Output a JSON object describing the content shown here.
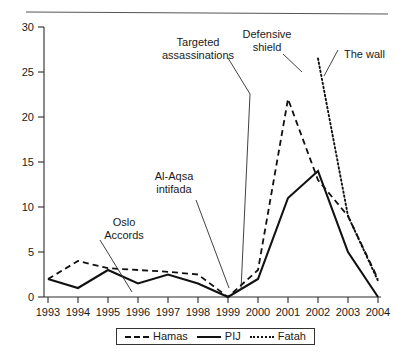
{
  "chart_data": {
    "type": "line",
    "title": "",
    "subtitle": "",
    "xlabel": "",
    "ylabel": "",
    "xlim": [
      1993,
      2004
    ],
    "ylim": [
      0,
      30
    ],
    "grid": false,
    "legend_position": "bottom",
    "x": [
      1993,
      1994,
      1995,
      1996,
      1997,
      1998,
      1999,
      2000,
      2001,
      2002,
      2003,
      2004
    ],
    "x_tick_labels": [
      "1993",
      "1994",
      "1995",
      "1996",
      "1997",
      "1998",
      "1999",
      "2000",
      "2001",
      "2002",
      "2003",
      "2004"
    ],
    "y_ticks": [
      0,
      5,
      10,
      15,
      20,
      25,
      30
    ],
    "y_tick_labels": [
      "0",
      "5",
      "10",
      "15",
      "20",
      "25",
      "30"
    ],
    "series": [
      {
        "name": "Hamas",
        "style": "dashed",
        "color": "#111111",
        "x": [
          1993,
          1994,
          1995,
          1996,
          1997,
          1998,
          1999,
          2000,
          2001,
          2002,
          2003,
          2004
        ],
        "values": [
          2,
          4,
          3.2,
          3,
          2.8,
          2.5,
          0,
          3,
          22,
          13,
          9,
          2
        ]
      },
      {
        "name": "PIJ",
        "style": "solid",
        "color": "#111111",
        "x": [
          1993,
          1994,
          1995,
          1996,
          1997,
          1998,
          1999,
          2000,
          2001,
          2002,
          2003,
          2004
        ],
        "values": [
          2,
          1,
          3,
          1.5,
          2.5,
          1.5,
          0,
          2,
          11,
          14,
          5,
          0
        ]
      },
      {
        "name": "Fatah",
        "style": "dotted",
        "color": "#111111",
        "x": [
          2002,
          2003,
          2004
        ],
        "values": [
          26.5,
          9,
          1.8
        ]
      }
    ],
    "annotations": [
      {
        "id": "oslo-accords",
        "text": "Oslo\nAccords",
        "lines": [
          "Oslo",
          "Accords"
        ],
        "target_year": 1994.7,
        "target_value": 0.5
      },
      {
        "id": "al-aqsa-intifada",
        "text": "Al-Aqsa\nintifada",
        "lines": [
          "Al-Aqsa",
          "intifada"
        ],
        "target_year": 1999.9,
        "target_value": 1.0
      },
      {
        "id": "targeted-assassinations",
        "text": "Targeted\nassassinations",
        "lines": [
          "Targeted",
          "assassinations"
        ],
        "target_year": 2000.4,
        "target_value": 1.2
      },
      {
        "id": "defensive-shield",
        "text": "Defensive\nshield",
        "lines": [
          "Defensive",
          "shield"
        ],
        "target_year": 2001.8,
        "target_value": 18.0
      },
      {
        "id": "the-wall",
        "text": "The wall",
        "lines": [
          "The wall"
        ],
        "target_year": 2002.3,
        "target_value": 24.0
      }
    ]
  },
  "legend": {
    "entries": [
      {
        "label": "Hamas",
        "style": "dashed"
      },
      {
        "label": "PIJ",
        "style": "solid"
      },
      {
        "label": "Fatah",
        "style": "dotted"
      }
    ]
  }
}
